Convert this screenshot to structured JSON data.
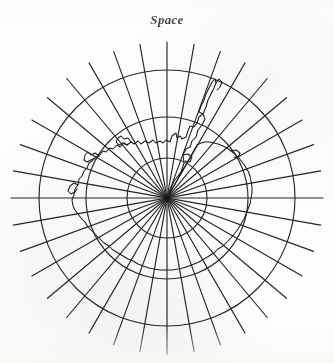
{
  "figure": {
    "title": "Space",
    "background_color": "#fdfdfc",
    "ink_color": "#262626",
    "coastline_color": "#1d1d1d"
  },
  "projection": {
    "type": "polar-azimuthal",
    "pole": "south",
    "center_x": 167,
    "center_y": 198,
    "meridian_count": 36,
    "meridian_spacing_degrees": 10,
    "meridian_inner_radius": 2,
    "meridian_outer_radius": 156,
    "parallel_radii": [
      40,
      81,
      128
    ],
    "parallel_count": 3,
    "graticule_stroke_width": 1.15,
    "coastline_stroke_width": 1.05
  },
  "coastline": {
    "name": "antarctica-coastline",
    "description": "Antarctic continental coastline with the Antarctic Peninsula extending toward the upper right",
    "path": "M 167 198 L 174 181 L 181 172 L 184 163 L 183 155 L 186 149 L 190 147 L 192 141 L 196 137 L 198 130 L 202 125 L 205 119 L 203 114 L 199 117 L 197 123 L 194 127 L 190 126 L 188 131 L 186 137 L 182 139 L 180 136 L 177 138 L 176 133 L 172 136 L 170 142 L 166 140 L 163 143 L 160 141 L 156 143 L 153 140 L 149 143 L 145 141 L 141 144 L 138 141 L 134 144 L 131 142 L 127 145 L 124 143 L 120 147 L 117 145 L 113 149 L 110 148 L 106 152 L 103 151 L 99 156 L 96 157 L 92 161 L 89 163 L 87 168 L 84 171 L 82 176 L 79 179 L 78 185 L 75 189 L 74 195 L 72 200 L 73 206 L 75 210 L 78 214 L 81 218 L 85 222 L 88 227 L 92 231 L 96 235 L 100 239 L 104 243 L 109 246 L 113 250 L 118 253 L 123 256 L 128 259 L 133 261 L 138 264 L 143 266 L 149 268 L 154 269 L 160 270 L 166 270 L 172 270 L 178 269 L 183 268 L 189 266 L 194 264 L 199 262 L 204 259 L 209 256 L 214 253 L 218 249 L 223 246 L 227 242 L 231 238 L 235 233 L 238 229 L 241 224 L 244 219 L 246 214 L 248 209 L 250 204 L 251 198 L 252 193 L 252 187 L 251 181 L 250 176 L 248 171 L 245 166 L 242 162 L 239 158 L 235 154 L 231 151 L 227 148 L 223 146 L 218 144 L 214 143 L 209 142 L 205 142 L 201 143 L 197 145 Z",
    "peninsula_path": "M 203 114 L 206 107 L 208 100 L 211 94 L 214 88 L 216 83 L 215 79 L 212 82 L 209 88 L 206 94 L 204 100 L 201 106 L 199 112 Z",
    "detail_paths": [
      "M 131 142 L 128 138 L 124 139 L 121 136 L 118 138 L 116 142 L 119 145 L 123 143 L 127 145",
      "M 99 156 L 95 153 L 91 155 L 88 152 L 85 155 L 84 160 L 87 162 L 91 160 L 95 158",
      "M 78 185 L 74 183 L 70 186 L 68 191 L 71 194 L 75 192 L 77 189",
      "M 216 83 L 219 79 L 222 82 L 220 87 L 217 90",
      "M 231 151 L 236 150 L 240 153 L 238 158 L 234 157",
      "M 183 155 L 188 154 L 192 157 L 190 162 L 185 161"
    ]
  }
}
